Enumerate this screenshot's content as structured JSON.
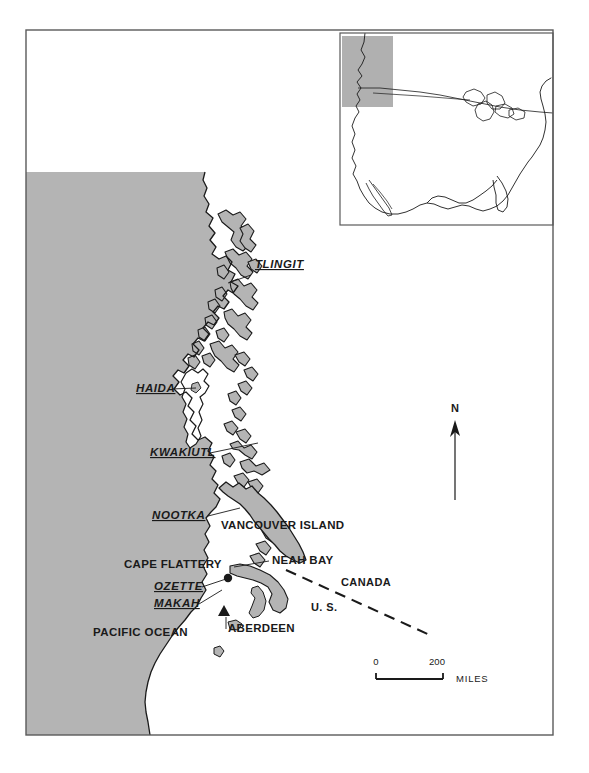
{
  "map": {
    "title": "Northwest Coast Culture Area Map",
    "colors": {
      "ocean_fill": "#b4b4b4",
      "land_fill": "#ffffff",
      "island_fill": "#b4b4b4",
      "coast_line": "#1a1a1a",
      "frame_line": "#4a4a4a",
      "text": "#1a1a1a",
      "inset_box_fill": "#b0b0b0"
    },
    "tribes": [
      {
        "name": "tlingit",
        "label": "TLINGIT",
        "x": 255,
        "y": 268
      },
      {
        "name": "haida",
        "label": "HAIDA",
        "x": 136,
        "y": 392
      },
      {
        "name": "kwakiutl",
        "label": "KWAKIUTL",
        "x": 150,
        "y": 456
      },
      {
        "name": "nootka",
        "label": "NOOTKA",
        "x": 152,
        "y": 519
      },
      {
        "name": "ozette",
        "label": "OZETTE",
        "x": 154,
        "y": 590
      },
      {
        "name": "makah",
        "label": "MAKAH",
        "x": 154,
        "y": 607
      }
    ],
    "places": [
      {
        "name": "vancouver-island",
        "label": "VANCOUVER ISLAND",
        "x": 221,
        "y": 529
      },
      {
        "name": "cape-flattery",
        "label": "CAPE FLATTERY",
        "x": 124,
        "y": 568
      },
      {
        "name": "neah-bay",
        "label": "NEAH BAY",
        "x": 272,
        "y": 564
      },
      {
        "name": "aberdeen",
        "label": "ABERDEEN",
        "x": 228,
        "y": 632
      }
    ],
    "ocean_label": {
      "label": "PACIFIC OCEAN",
      "x": 93,
      "y": 636
    },
    "countries": [
      {
        "name": "canada",
        "label": "CANADA",
        "x": 341,
        "y": 586
      },
      {
        "name": "united-states",
        "label": "U. S.",
        "x": 311,
        "y": 611
      }
    ],
    "north_arrow": {
      "label": "N",
      "x": 451,
      "y": 412
    },
    "scale_bar": {
      "min": "0",
      "max": "200",
      "unit": "MILES",
      "min_x": 376,
      "max_x": 437,
      "label_y": 665,
      "bar_y": 679,
      "bar_x1": 376,
      "bar_x2": 443,
      "unit_x": 456,
      "unit_y": 682
    },
    "markers": [
      {
        "name": "ozette-site-marker",
        "type": "circle",
        "x": 228,
        "y": 578
      },
      {
        "name": "aberdeen-site-marker",
        "type": "triangle",
        "x": 224,
        "y": 613
      }
    ],
    "inset": {
      "name": "united-states-locator-inset",
      "frame": {
        "x": 340,
        "y": 33,
        "width": 213,
        "height": 192
      },
      "highlight_box": {
        "x": 342,
        "y": 36,
        "width": 51,
        "height": 71
      }
    },
    "frame": {
      "x": 26,
      "y": 30,
      "width": 527,
      "height": 705
    }
  }
}
